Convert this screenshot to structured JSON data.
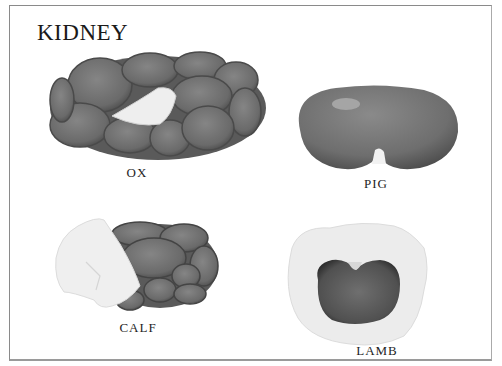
{
  "title": "KIDNEY",
  "specimens": [
    {
      "label": "OX",
      "description": "multilobed kidney, many rounded lobes with pale hilum fat"
    },
    {
      "label": "PIG",
      "description": "smooth bean-shaped kidney, flattened"
    },
    {
      "label": "CALF",
      "description": "lobulated kidney partly covered by white fat"
    },
    {
      "label": "LAMB",
      "description": "small bean-shaped kidney embedded in suet"
    }
  ],
  "colors": {
    "kidney_dark": "#5e5e5e",
    "kidney_mid": "#7a7a7a",
    "fat": "#ececec",
    "frame": "#8a8a8a"
  }
}
